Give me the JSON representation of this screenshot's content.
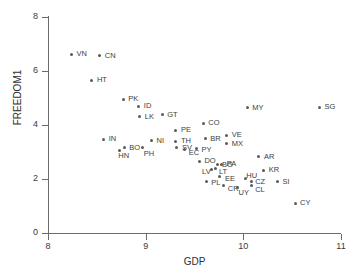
{
  "chart_data": {
    "type": "scatter",
    "title": "",
    "xlabel": "GDP",
    "ylabel": "FREEDOM1",
    "xlim": [
      8,
      11
    ],
    "ylim": [
      0,
      8
    ],
    "xticks": [
      "8",
      "9",
      "10",
      "11"
    ],
    "yticks": [
      "0",
      "2",
      "4",
      "6",
      "8"
    ],
    "grid": false,
    "legend": "none",
    "marker_color": "#5a5a5a",
    "axis_color": "#6b6b6b",
    "points": [
      {
        "label": "VN",
        "x": 8.24,
        "y": 6.62,
        "lx": 5,
        "ly": -4
      },
      {
        "label": "CN",
        "x": 8.53,
        "y": 6.57,
        "lx": 5,
        "ly": -4
      },
      {
        "label": "HT",
        "x": 8.45,
        "y": 5.65,
        "lx": 5,
        "ly": -4
      },
      {
        "label": "PK",
        "x": 8.77,
        "y": 4.95,
        "lx": 5,
        "ly": -4
      },
      {
        "label": "ID",
        "x": 8.93,
        "y": 4.69,
        "lx": 5,
        "ly": -4
      },
      {
        "label": "LK",
        "x": 8.94,
        "y": 4.31,
        "lx": 5,
        "ly": -4
      },
      {
        "label": "GT",
        "x": 9.17,
        "y": 4.38,
        "lx": 5,
        "ly": -4
      },
      {
        "label": "CO",
        "x": 9.59,
        "y": 4.06,
        "lx": 5,
        "ly": -4
      },
      {
        "label": "MY",
        "x": 10.04,
        "y": 4.63,
        "lx": 5,
        "ly": -4
      },
      {
        "label": "SG",
        "x": 10.78,
        "y": 4.66,
        "lx": 5,
        "ly": -4
      },
      {
        "label": "PE",
        "x": 9.31,
        "y": 3.8,
        "lx": 5,
        "ly": -4
      },
      {
        "label": "VE",
        "x": 9.83,
        "y": 3.62,
        "lx": 5,
        "ly": -4
      },
      {
        "label": "IN",
        "x": 8.57,
        "y": 3.47,
        "lx": 5,
        "ly": -4
      },
      {
        "label": "NI",
        "x": 9.06,
        "y": 3.42,
        "lx": 5,
        "ly": -4
      },
      {
        "label": "TH",
        "x": 9.31,
        "y": 3.4,
        "lx": 5,
        "ly": -4
      },
      {
        "label": "BR",
        "x": 9.61,
        "y": 3.49,
        "lx": 5,
        "ly": -4
      },
      {
        "label": "MX",
        "x": 9.83,
        "y": 3.31,
        "lx": 5,
        "ly": -4
      },
      {
        "label": "BO",
        "x": 8.78,
        "y": 3.16,
        "lx": 5,
        "ly": -4
      },
      {
        "label": "PH",
        "x": 8.97,
        "y": 3.16,
        "lx": 1,
        "ly": 2
      },
      {
        "label": "HN",
        "x": 8.73,
        "y": 3.06,
        "lx": -1,
        "ly": 2
      },
      {
        "label": "SV",
        "x": 9.32,
        "y": 3.16,
        "lx": 5,
        "ly": -4
      },
      {
        "label": "EC",
        "x": 9.4,
        "y": 3.09,
        "lx": 4,
        "ly": -1
      },
      {
        "label": "PY",
        "x": 9.52,
        "y": 3.12,
        "lx": 5,
        "ly": -3
      },
      {
        "label": "DO",
        "x": 9.55,
        "y": 2.65,
        "lx": 5,
        "ly": -4
      },
      {
        "label": "AR",
        "x": 10.16,
        "y": 2.82,
        "lx": 5,
        "ly": -4
      },
      {
        "label": "BG",
        "x": 9.74,
        "y": 2.52,
        "lx": 4,
        "ly": -4
      },
      {
        "label": "PA",
        "x": 9.78,
        "y": 2.53,
        "lx": 5,
        "ly": -5
      },
      {
        "label": "LV",
        "x": 9.67,
        "y": 2.36,
        "lx": -9,
        "ly": -1
      },
      {
        "label": "LT",
        "x": 9.72,
        "y": 2.38,
        "lx": 3,
        "ly": -1
      },
      {
        "label": "KR",
        "x": 10.21,
        "y": 2.32,
        "lx": 5,
        "ly": -4
      },
      {
        "label": "EE",
        "x": 9.76,
        "y": 2.09,
        "lx": 5,
        "ly": -2
      },
      {
        "label": "HU",
        "x": 10.02,
        "y": 2.03,
        "lx": 1,
        "ly": -6
      },
      {
        "label": "PL",
        "x": 9.62,
        "y": 1.91,
        "lx": 5,
        "ly": -2
      },
      {
        "label": "CZ",
        "x": 10.08,
        "y": 1.92,
        "lx": 4,
        "ly": -3
      },
      {
        "label": "SI",
        "x": 10.35,
        "y": 1.9,
        "lx": 5,
        "ly": -4
      },
      {
        "label": "CR",
        "x": 9.8,
        "y": 1.75,
        "lx": 4,
        "ly": -1
      },
      {
        "label": "UY",
        "x": 9.94,
        "y": 1.7,
        "lx": 1,
        "ly": 2
      },
      {
        "label": "CL",
        "x": 10.08,
        "y": 1.76,
        "lx": 4,
        "ly": 1
      },
      {
        "label": "CY",
        "x": 10.53,
        "y": 1.1,
        "lx": 5,
        "ly": -4
      }
    ]
  }
}
